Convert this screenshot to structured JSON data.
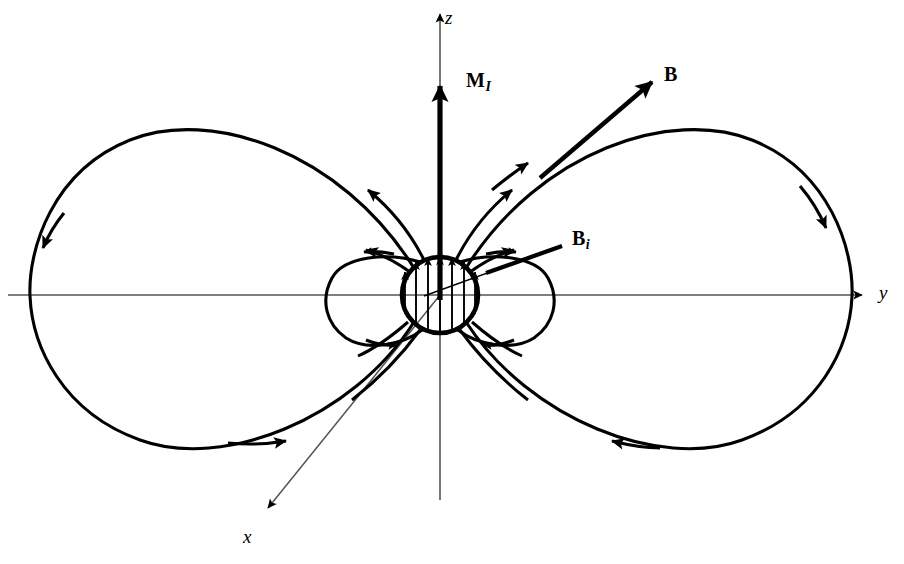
{
  "figure": {
    "background_color": "#ffffff",
    "stroke_color": "#000000",
    "axis_color": "#555555",
    "width": 904,
    "height": 564
  },
  "axes": [
    {
      "id": "z",
      "label": "z",
      "orientation": "vertical",
      "arrow": "up",
      "style": "italic"
    },
    {
      "id": "y",
      "label": "y",
      "orientation": "horizontal",
      "arrow": "right",
      "style": "italic"
    },
    {
      "id": "x",
      "label": "x",
      "orientation": "diagonal-down-left",
      "arrow": "down-left",
      "style": "italic"
    }
  ],
  "vectors": [
    {
      "id": "M",
      "label": "M",
      "subscript": "I",
      "description": "magnetization vector along +z",
      "weight": "thick"
    },
    {
      "id": "B",
      "label": "B",
      "subscript": "",
      "description": "external field tangent arrow on outer field line",
      "weight": "thick"
    },
    {
      "id": "Bi",
      "label": "B",
      "subscript": "i",
      "description": "interior field leader line pointing into sphere",
      "weight": "thick"
    }
  ],
  "sphere": {
    "center_x": 440,
    "center_y": 295,
    "radius": 38,
    "interior_arrow_count": 7,
    "interior_arrow_direction": "up",
    "outline_weight": "thick"
  },
  "field_lines": {
    "outer_lobe_count": 2,
    "inner_loop_count": 2,
    "near_sphere_line_count": 8,
    "arrow_direction_note": "clockwise on right lobe, counter-clockwise on left lobe; flux exits north pole and re-enters south pole"
  }
}
